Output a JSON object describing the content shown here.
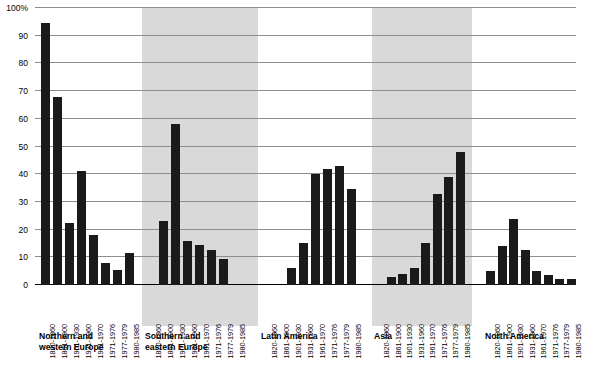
{
  "chart_data": {
    "type": "bar",
    "title": "",
    "xlabel": "",
    "ylabel": "",
    "ylim": [
      0,
      100
    ],
    "grid": true,
    "legend": "none",
    "y_ticks": [
      "0",
      "10",
      "20",
      "30",
      "40",
      "50",
      "60",
      "70",
      "80",
      "90",
      "100%"
    ],
    "y_tick_values": [
      0,
      10,
      20,
      30,
      40,
      50,
      60,
      70,
      80,
      90,
      100
    ],
    "categories": [
      "1820-1860",
      "1861-1900",
      "1901-1930",
      "1931-1960",
      "1961-1970",
      "1971-1976",
      "1977-1979",
      "1980-1985"
    ],
    "series": [
      {
        "name": "Northern and\nwestern Europe",
        "shaded": false,
        "values": [
          94.5,
          68,
          22.5,
          41,
          18,
          8,
          5.5,
          11.5
        ]
      },
      {
        "name": "Southern and\neastern Europe",
        "shaded": true,
        "values": [
          0,
          23,
          58,
          16,
          14.5,
          12.5,
          9.5,
          0
        ]
      },
      {
        "name": "Latin America",
        "shaded": false,
        "values": [
          0,
          0,
          6,
          15,
          40,
          42,
          43,
          34.5
        ]
      },
      {
        "name": "Asia",
        "shaded": true,
        "values": [
          0,
          3,
          4,
          6,
          15,
          33,
          39,
          48
        ]
      },
      {
        "name": "North America",
        "shaded": false,
        "values": [
          5,
          14,
          24,
          12.5,
          5,
          3.5,
          2,
          2
        ]
      }
    ]
  },
  "colors": {
    "bar": "#1a1a1a",
    "band": "#d9d9d9",
    "gridline": "#8d8d8d",
    "axis": "#000000",
    "background": "#ffffff"
  }
}
